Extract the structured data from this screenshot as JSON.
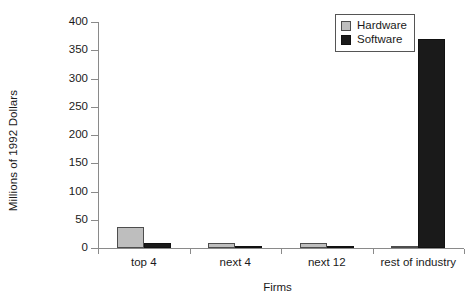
{
  "chart_data": {
    "type": "bar",
    "title": "",
    "subtitle": "",
    "xlabel": "Firms",
    "ylabel": "Millions of 1992 Dollars",
    "categories": [
      "top 4",
      "next 4",
      "next 12",
      "rest of industry"
    ],
    "series": [
      {
        "name": "Hardware",
        "color": "#bebebe",
        "values": [
          37,
          9,
          8,
          2
        ]
      },
      {
        "name": "Software",
        "color": "#1a1a1a",
        "values": [
          9,
          4,
          3,
          370
        ]
      }
    ],
    "ylim": [
      0,
      400
    ],
    "yticks": [
      0,
      50,
      100,
      150,
      200,
      250,
      300,
      350,
      400
    ],
    "ytick_labels": [
      "0",
      "50",
      "100",
      "150",
      "200",
      "250",
      "300",
      "350",
      "400"
    ],
    "grid": false,
    "legend": {
      "position": "top-right",
      "entries": [
        {
          "label": "Hardware",
          "swatch": "hardware-swatch",
          "color": "#bebebe"
        },
        {
          "label": "Software",
          "swatch": "software-swatch",
          "color": "#1a1a1a"
        }
      ]
    },
    "axis_color": "#8a8a8a"
  }
}
